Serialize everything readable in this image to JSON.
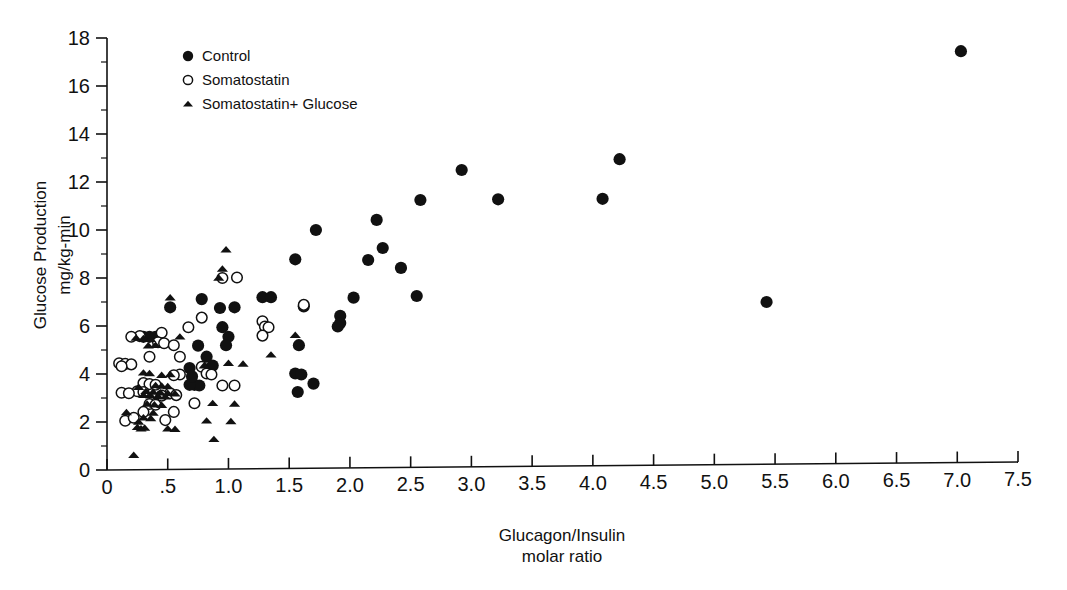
{
  "figure": {
    "background_color": "#ffffff",
    "ink_color": "#111111"
  },
  "legend": {
    "position": "top-left-inside",
    "entries": [
      {
        "label": "Control",
        "marker": "filled-circle"
      },
      {
        "label": "Somatostatin",
        "marker": "open-circle"
      },
      {
        "label": "Somatostatin+ Glucose",
        "marker": "filled-triangle"
      }
    ]
  },
  "axes": {
    "y_title_line1": "Glucose Production",
    "y_title_line2": "mg/kg-min",
    "x_title_line1": "Glucagon/Insulin",
    "x_title_line2": "molar ratio",
    "x_tick_labels": [
      "0",
      ".5",
      "1.0",
      "1.5",
      "2.0",
      "2.5",
      "3.0",
      "3.5",
      "4.0",
      "4.5",
      "5.0",
      "5.5",
      "6.0",
      "6.5",
      "7.0",
      "7.5"
    ],
    "y_tick_labels": [
      "0",
      "2",
      "4",
      "6",
      "8",
      "10",
      "12",
      "14",
      "16",
      "18"
    ]
  },
  "chart_data": {
    "type": "scatter",
    "title": "",
    "xlabel": "Glucagon/Insulin molar ratio",
    "ylabel": "Glucose Production mg/kg-min",
    "xlim": [
      0,
      7.5
    ],
    "ylim": [
      0,
      18
    ],
    "xticks": [
      0,
      0.5,
      1.0,
      1.5,
      2.0,
      2.5,
      3.0,
      3.5,
      4.0,
      4.5,
      5.0,
      5.5,
      6.0,
      6.5,
      7.0,
      7.5
    ],
    "yticks": [
      0,
      2,
      4,
      6,
      8,
      10,
      12,
      14,
      16,
      18
    ],
    "y_minor_ticks": [
      1,
      3,
      5,
      7,
      9,
      11,
      13,
      15,
      17
    ],
    "grid": false,
    "legend_position": "upper left",
    "series": [
      {
        "name": "Control",
        "marker": "filled-circle",
        "color": "#111111",
        "points": [
          [
            7.03,
            17.45
          ],
          [
            4.22,
            12.95
          ],
          [
            2.92,
            12.5
          ],
          [
            4.08,
            11.3
          ],
          [
            3.22,
            11.28
          ],
          [
            2.58,
            11.25
          ],
          [
            2.22,
            10.42
          ],
          [
            1.72,
            10.0
          ],
          [
            2.27,
            9.25
          ],
          [
            1.55,
            8.78
          ],
          [
            2.15,
            8.75
          ],
          [
            2.42,
            8.42
          ],
          [
            5.43,
            7.0
          ],
          [
            2.55,
            7.25
          ],
          [
            2.03,
            7.18
          ],
          [
            1.28,
            7.2
          ],
          [
            1.35,
            7.2
          ],
          [
            0.78,
            7.12
          ],
          [
            1.62,
            6.82
          ],
          [
            0.93,
            6.75
          ],
          [
            1.05,
            6.78
          ],
          [
            0.52,
            6.78
          ],
          [
            1.92,
            6.42
          ],
          [
            1.92,
            6.12
          ],
          [
            1.9,
            5.98
          ],
          [
            0.95,
            5.95
          ],
          [
            1.0,
            5.55
          ],
          [
            1.58,
            5.2
          ],
          [
            0.75,
            5.18
          ],
          [
            0.98,
            5.2
          ],
          [
            0.3,
            5.55
          ],
          [
            0.35,
            5.55
          ],
          [
            0.4,
            5.55
          ],
          [
            0.82,
            4.72
          ],
          [
            0.87,
            4.35
          ],
          [
            0.68,
            4.25
          ],
          [
            1.55,
            4.02
          ],
          [
            1.6,
            3.98
          ],
          [
            1.7,
            3.6
          ],
          [
            0.72,
            3.55
          ],
          [
            0.76,
            3.52
          ],
          [
            0.68,
            3.55
          ],
          [
            1.57,
            3.25
          ],
          [
            0.7,
            3.9
          ]
        ]
      },
      {
        "name": "Somatostatin",
        "marker": "open-circle",
        "color": "#ffffff",
        "points": [
          [
            1.07,
            8.02
          ],
          [
            0.95,
            8.0
          ],
          [
            1.62,
            6.88
          ],
          [
            1.28,
            6.2
          ],
          [
            1.3,
            5.98
          ],
          [
            1.33,
            5.95
          ],
          [
            1.28,
            5.6
          ],
          [
            0.78,
            6.35
          ],
          [
            0.67,
            5.95
          ],
          [
            0.45,
            5.72
          ],
          [
            0.27,
            5.58
          ],
          [
            0.2,
            5.55
          ],
          [
            0.42,
            5.32
          ],
          [
            0.47,
            5.28
          ],
          [
            0.55,
            5.2
          ],
          [
            0.6,
            4.72
          ],
          [
            0.35,
            4.72
          ],
          [
            0.1,
            4.45
          ],
          [
            0.15,
            4.42
          ],
          [
            0.2,
            4.4
          ],
          [
            0.12,
            4.32
          ],
          [
            0.78,
            4.3
          ],
          [
            0.82,
            4.02
          ],
          [
            0.86,
            3.98
          ],
          [
            0.6,
            3.98
          ],
          [
            0.55,
            3.95
          ],
          [
            0.3,
            3.62
          ],
          [
            0.35,
            3.58
          ],
          [
            0.4,
            3.55
          ],
          [
            0.95,
            3.52
          ],
          [
            1.05,
            3.52
          ],
          [
            0.25,
            3.28
          ],
          [
            0.3,
            3.25
          ],
          [
            0.12,
            3.22
          ],
          [
            0.18,
            3.2
          ],
          [
            0.52,
            3.2
          ],
          [
            0.57,
            3.12
          ],
          [
            0.45,
            3.1
          ],
          [
            0.72,
            2.78
          ],
          [
            0.35,
            2.75
          ],
          [
            0.4,
            2.72
          ],
          [
            0.3,
            2.42
          ],
          [
            0.55,
            2.42
          ],
          [
            0.48,
            2.08
          ],
          [
            0.15,
            2.05
          ],
          [
            0.22,
            2.18
          ]
        ]
      },
      {
        "name": "Somatostatin+ Glucose",
        "marker": "filled-triangle",
        "color": "#111111",
        "points": [
          [
            0.98,
            9.18
          ],
          [
            0.95,
            8.38
          ],
          [
            0.92,
            8.0
          ],
          [
            0.52,
            7.18
          ],
          [
            1.55,
            5.62
          ],
          [
            1.35,
            4.8
          ],
          [
            1.0,
            4.45
          ],
          [
            1.12,
            4.42
          ],
          [
            0.8,
            4.35
          ],
          [
            0.3,
            4.05
          ],
          [
            0.35,
            4.02
          ],
          [
            0.52,
            3.98
          ],
          [
            0.45,
            3.95
          ],
          [
            0.4,
            3.52
          ],
          [
            0.45,
            3.5
          ],
          [
            0.5,
            3.48
          ],
          [
            0.26,
            3.45
          ],
          [
            0.32,
            3.28
          ],
          [
            0.38,
            3.25
          ],
          [
            0.44,
            3.22
          ],
          [
            0.5,
            3.2
          ],
          [
            0.56,
            3.18
          ],
          [
            0.3,
            3.12
          ],
          [
            0.36,
            3.1
          ],
          [
            0.42,
            3.08
          ],
          [
            0.48,
            3.05
          ],
          [
            0.87,
            2.78
          ],
          [
            1.05,
            2.75
          ],
          [
            0.33,
            2.75
          ],
          [
            0.39,
            2.72
          ],
          [
            0.45,
            2.7
          ],
          [
            0.16,
            2.4
          ],
          [
            0.38,
            2.38
          ],
          [
            0.3,
            2.18
          ],
          [
            0.36,
            2.15
          ],
          [
            0.82,
            2.05
          ],
          [
            1.02,
            2.02
          ],
          [
            0.25,
            1.78
          ],
          [
            0.31,
            1.75
          ],
          [
            0.5,
            1.72
          ],
          [
            0.56,
            1.7
          ],
          [
            0.28,
            1.72
          ],
          [
            0.88,
            1.28
          ],
          [
            0.22,
            0.62
          ],
          [
            0.24,
            5.5
          ],
          [
            0.3,
            5.48
          ],
          [
            0.36,
            5.45
          ],
          [
            0.4,
            5.2
          ],
          [
            0.34,
            5.18
          ],
          [
            0.26,
            2.0
          ],
          [
            0.6,
            5.55
          ]
        ]
      }
    ]
  }
}
